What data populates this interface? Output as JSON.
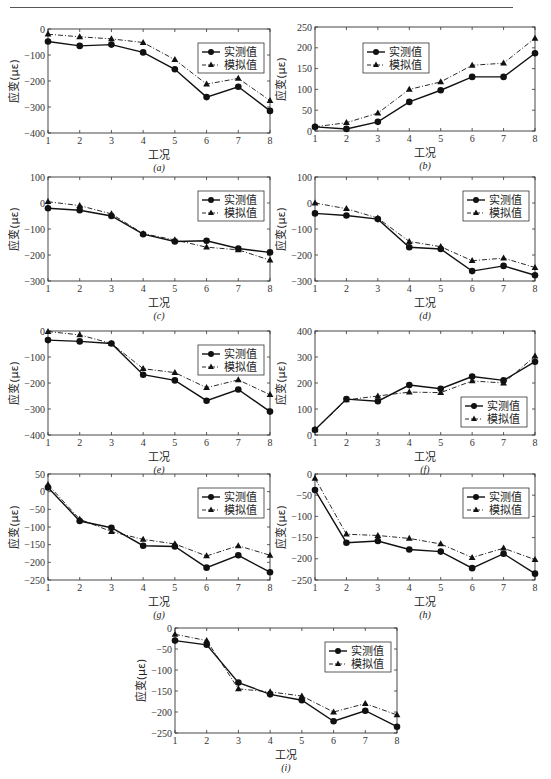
{
  "page": {
    "header_rule": true
  },
  "legend": {
    "measured": "实测值",
    "simulated": "模拟值"
  },
  "axis": {
    "xlabel": "工况",
    "ylabel": "应变(με)"
  },
  "chart_data": [
    {
      "type": "line",
      "panel": "(a)",
      "x": [
        1,
        2,
        3,
        4,
        5,
        6,
        7,
        8
      ],
      "xlabel": "工况",
      "ylabel": "应变(με)",
      "ylim": [
        -400,
        0
      ],
      "yticks": [
        0,
        -100,
        -200,
        -300,
        -400
      ],
      "legend_pos": "upper-right",
      "series": [
        {
          "name": "实测值",
          "marker": "circle",
          "line": "solid",
          "values": [
            -48,
            -65,
            -60,
            -90,
            -155,
            -262,
            -222,
            -315
          ]
        },
        {
          "name": "模拟值",
          "marker": "triangle",
          "line": "dashdot",
          "values": [
            -20,
            -30,
            -38,
            -52,
            -118,
            -212,
            -190,
            -275
          ]
        }
      ],
      "box": {
        "x": 48,
        "y": 29,
        "w": 222,
        "h": 104
      }
    },
    {
      "type": "line",
      "panel": "(b)",
      "x": [
        1,
        2,
        3,
        4,
        5,
        6,
        7,
        8
      ],
      "xlabel": "工况",
      "ylabel": "应变(με)",
      "ylim": [
        0,
        250
      ],
      "yticks": [
        250,
        200,
        150,
        100,
        50,
        0
      ],
      "legend_pos": "upper-left",
      "series": [
        {
          "name": "实测值",
          "marker": "circle",
          "line": "solid",
          "values": [
            10,
            5,
            22,
            70,
            98,
            130,
            130,
            187
          ]
        },
        {
          "name": "模拟值",
          "marker": "triangle",
          "line": "dashdot",
          "values": [
            10,
            20,
            43,
            100,
            118,
            158,
            163,
            223
          ]
        }
      ],
      "box": {
        "x": 315,
        "y": 27,
        "w": 220,
        "h": 104
      }
    },
    {
      "type": "line",
      "panel": "(c)",
      "x": [
        1,
        2,
        3,
        4,
        5,
        6,
        7,
        8
      ],
      "xlabel": "工况",
      "ylabel": "应变(με)",
      "ylim": [
        -300,
        100
      ],
      "yticks": [
        100,
        0,
        -100,
        -200,
        -300
      ],
      "legend_pos": "upper-right",
      "series": [
        {
          "name": "实测值",
          "marker": "circle",
          "line": "solid",
          "values": [
            -20,
            -28,
            -50,
            -120,
            -148,
            -145,
            -175,
            -190
          ]
        },
        {
          "name": "模拟值",
          "marker": "triangle",
          "line": "dashdot",
          "values": [
            5,
            -10,
            -42,
            -118,
            -142,
            -170,
            -180,
            -220
          ]
        }
      ],
      "box": {
        "x": 48,
        "y": 177,
        "w": 222,
        "h": 104
      }
    },
    {
      "type": "line",
      "panel": "(d)",
      "x": [
        1,
        2,
        3,
        4,
        5,
        6,
        7,
        8
      ],
      "xlabel": "工况",
      "ylabel": "应变(με)",
      "ylim": [
        -300,
        100
      ],
      "yticks": [
        100,
        0,
        -100,
        -200,
        -300
      ],
      "legend_pos": "upper-right",
      "series": [
        {
          "name": "实测值",
          "marker": "circle",
          "line": "solid",
          "values": [
            -40,
            -48,
            -62,
            -170,
            -177,
            -262,
            -242,
            -278
          ]
        },
        {
          "name": "模拟值",
          "marker": "triangle",
          "line": "dashdot",
          "values": [
            0,
            -22,
            -58,
            -148,
            -168,
            -222,
            -212,
            -248
          ]
        }
      ],
      "box": {
        "x": 315,
        "y": 177,
        "w": 220,
        "h": 104
      }
    },
    {
      "type": "line",
      "panel": "(e)",
      "x": [
        1,
        2,
        3,
        4,
        5,
        6,
        7,
        8
      ],
      "xlabel": "工况",
      "ylabel": "应变(με)",
      "ylim": [
        -400,
        0
      ],
      "yticks": [
        0,
        -100,
        -200,
        -300,
        -400
      ],
      "legend_pos": "upper-right",
      "series": [
        {
          "name": "实测值",
          "marker": "circle",
          "line": "solid",
          "values": [
            -35,
            -40,
            -48,
            -168,
            -190,
            -268,
            -225,
            -310
          ]
        },
        {
          "name": "模拟值",
          "marker": "triangle",
          "line": "dashdot",
          "values": [
            -2,
            -15,
            -48,
            -145,
            -160,
            -218,
            -188,
            -245
          ]
        }
      ],
      "box": {
        "x": 48,
        "y": 331,
        "w": 222,
        "h": 104
      }
    },
    {
      "type": "line",
      "panel": "(f)",
      "x": [
        1,
        2,
        3,
        4,
        5,
        6,
        7,
        8
      ],
      "xlabel": "工况",
      "ylabel": "应变(με)",
      "ylim": [
        0,
        400
      ],
      "yticks": [
        400,
        300,
        200,
        100,
        0
      ],
      "legend_pos": "lower-right",
      "series": [
        {
          "name": "实测值",
          "marker": "circle",
          "line": "solid",
          "values": [
            20,
            138,
            130,
            192,
            178,
            225,
            210,
            282
          ]
        },
        {
          "name": "模拟值",
          "marker": "triangle",
          "line": "dashdot",
          "values": [
            20,
            135,
            150,
            165,
            163,
            208,
            200,
            303
          ]
        }
      ],
      "box": {
        "x": 315,
        "y": 331,
        "w": 220,
        "h": 104
      }
    },
    {
      "type": "line",
      "panel": "(g)",
      "x": [
        1,
        2,
        3,
        4,
        5,
        6,
        7,
        8
      ],
      "xlabel": "工况",
      "ylabel": "应变(με)",
      "ylim": [
        -250,
        50
      ],
      "yticks": [
        50,
        0,
        -50,
        -100,
        -150,
        -200,
        -250
      ],
      "legend_pos": "upper-right",
      "series": [
        {
          "name": "实测值",
          "marker": "circle",
          "line": "solid",
          "values": [
            12,
            -83,
            -102,
            -153,
            -155,
            -215,
            -180,
            -228
          ]
        },
        {
          "name": "模拟值",
          "marker": "triangle",
          "line": "dashdot",
          "values": [
            20,
            -78,
            -113,
            -135,
            -148,
            -182,
            -153,
            -180
          ]
        }
      ],
      "box": {
        "x": 48,
        "y": 474,
        "w": 222,
        "h": 106
      }
    },
    {
      "type": "line",
      "panel": "(h)",
      "x": [
        1,
        2,
        3,
        4,
        5,
        6,
        7,
        8
      ],
      "xlabel": "工况",
      "ylabel": "应变(με)",
      "ylim": [
        -250,
        0
      ],
      "yticks": [
        0,
        -50,
        -100,
        -150,
        -200,
        -250
      ],
      "legend_pos": "upper-right",
      "series": [
        {
          "name": "实测值",
          "marker": "circle",
          "line": "solid",
          "values": [
            -38,
            -162,
            -158,
            -178,
            -183,
            -222,
            -188,
            -235
          ]
        },
        {
          "name": "模拟值",
          "marker": "triangle",
          "line": "dashdot",
          "values": [
            -10,
            -142,
            -145,
            -152,
            -165,
            -197,
            -175,
            -202
          ]
        }
      ],
      "box": {
        "x": 315,
        "y": 474,
        "w": 220,
        "h": 106
      }
    },
    {
      "type": "line",
      "panel": "(i)",
      "x": [
        1,
        2,
        3,
        4,
        5,
        6,
        7,
        8
      ],
      "xlabel": "工况",
      "ylabel": "应变(με)",
      "ylim": [
        -250,
        0
      ],
      "yticks": [
        0,
        -50,
        -100,
        -150,
        -200,
        -250
      ],
      "legend_pos": "upper-right",
      "series": [
        {
          "name": "实测值",
          "marker": "circle",
          "line": "solid",
          "values": [
            -30,
            -40,
            -130,
            -158,
            -172,
            -222,
            -197,
            -235
          ]
        },
        {
          "name": "模拟值",
          "marker": "triangle",
          "line": "dashdot",
          "values": [
            -15,
            -30,
            -145,
            -152,
            -162,
            -200,
            -180,
            -207
          ]
        }
      ],
      "box": {
        "x": 175,
        "y": 628,
        "w": 222,
        "h": 105
      }
    }
  ]
}
